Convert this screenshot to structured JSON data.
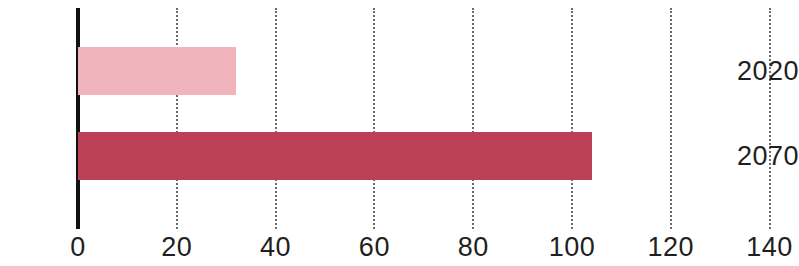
{
  "chart_data": {
    "type": "bar",
    "orientation": "horizontal",
    "title": "",
    "xlabel": "",
    "ylabel": "",
    "categories": [
      "2020",
      "2070"
    ],
    "values": [
      32,
      104
    ],
    "series": [
      {
        "name": "value",
        "values": [
          32,
          104
        ],
        "colors": [
          "#F2B4BC",
          "#BC4057"
        ]
      }
    ],
    "xlim": [
      0,
      145
    ],
    "x_ticks": [
      0,
      20,
      40,
      60,
      80,
      100,
      120,
      140
    ],
    "x_tick_labels": [
      "0",
      "20",
      "40",
      "60",
      "80",
      "100",
      "120",
      "140"
    ],
    "y_tick_labels": [
      "2020",
      "2070"
    ],
    "grid": {
      "vertical": true,
      "horizontal": false,
      "style": "dotted",
      "color": "#6b6b6b"
    },
    "legend": {
      "visible": false,
      "position": "none"
    },
    "axis": {
      "y_spine_color": "#111111",
      "y_spine_visible": true,
      "x_spine_visible": false
    },
    "bar_colors": {
      "2020": "#F2B4BC",
      "2070": "#BC4057"
    },
    "background_color": "#FFFFFF"
  }
}
